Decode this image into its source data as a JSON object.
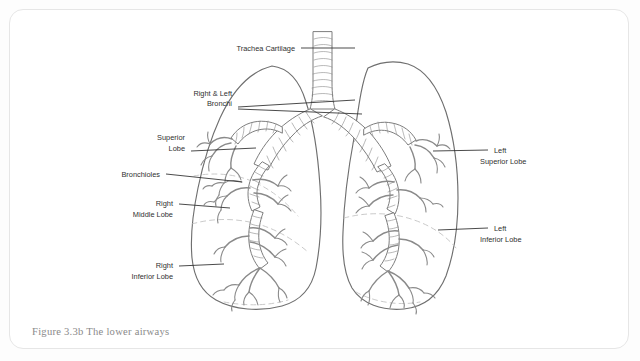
{
  "figure": {
    "caption": "Figure 3.3b The lower airways",
    "title": "The lower airways",
    "diagram_type": "labeled anatomical line drawing"
  },
  "colors": {
    "page_background": "#fdfdfd",
    "card_background": "#ffffff",
    "card_border": "#e6e6e6",
    "outline_stroke": "#6f6f6f",
    "airway_stroke": "#7d7d7d",
    "cartilage_ring_stroke": "#8d8d8d",
    "fissure_stroke": "#c0c0c0",
    "leader_line": "#2b2b2b",
    "label_text": "#2f2f2f",
    "caption_text": "#8a8a8a"
  },
  "labels": [
    {
      "id": "trachea-cartilage",
      "lines": [
        "Trachea Cartilage"
      ],
      "side": "top",
      "align": "end",
      "text_x": 285,
      "text_y": 41,
      "leader": [
        [
          291,
          38
        ],
        [
          345,
          38
        ]
      ]
    },
    {
      "id": "right-and-left-bronchi",
      "lines": [
        "Right & Left",
        "Bronchi"
      ],
      "side": "left",
      "align": "end",
      "text_x": 222,
      "text_y": 86,
      "leader": [
        [
          228,
          97
        ],
        [
          345,
          90
        ]
      ],
      "leader2": [
        [
          228,
          99
        ],
        [
          352,
          104
        ]
      ]
    },
    {
      "id": "superior-lobe",
      "lines": [
        "Superior",
        "Lobe"
      ],
      "side": "left",
      "align": "end",
      "text_x": 175,
      "text_y": 130,
      "leader": [
        [
          181,
          141
        ],
        [
          246,
          138
        ]
      ]
    },
    {
      "id": "bronchioles",
      "lines": [
        "Bronchioles"
      ],
      "side": "left",
      "align": "end",
      "text_x": 150,
      "text_y": 167,
      "leader": [
        [
          156,
          164
        ],
        [
          232,
          172
        ]
      ]
    },
    {
      "id": "right-middle-lobe",
      "lines": [
        "Right",
        "Middle Lobe"
      ],
      "side": "left",
      "align": "end",
      "text_x": 163,
      "text_y": 196,
      "leader": [
        [
          169,
          194
        ],
        [
          220,
          198
        ]
      ]
    },
    {
      "id": "right-inferior-lobe",
      "lines": [
        "Right",
        "Inferior Lobe"
      ],
      "side": "left",
      "align": "end",
      "text_x": 163,
      "text_y": 258,
      "leader": [
        [
          169,
          256
        ],
        [
          214,
          254
        ]
      ]
    },
    {
      "id": "left-superior-lobe",
      "lines": [
        "Left",
        "Superior Lobe"
      ],
      "side": "right",
      "align": "start",
      "text_x": 484,
      "text_y": 143,
      "leader": [
        [
          478,
          140
        ],
        [
          423,
          141
        ]
      ]
    },
    {
      "id": "left-inferior-lobe",
      "lines": [
        "Left",
        "Inferior Lobe"
      ],
      "side": "right",
      "align": "start",
      "text_x": 484,
      "text_y": 221,
      "leader": [
        [
          478,
          218
        ],
        [
          428,
          220
        ]
      ]
    }
  ],
  "anatomy": {
    "trachea": {
      "name": "trachea",
      "cartilage_rings_visible": true,
      "ring_count": 11,
      "top_y": 22,
      "bifurcation_y": 100
    },
    "bronchi": [
      {
        "name": "right-main-bronchus",
        "side": "right"
      },
      {
        "name": "left-main-bronchus",
        "side": "left"
      }
    ],
    "lungs": [
      {
        "name": "right-lung",
        "side": "right",
        "lobes": [
          "Superior Lobe",
          "Right Middle Lobe",
          "Right Inferior Lobe"
        ],
        "fissures": 2
      },
      {
        "name": "left-lung",
        "side": "left",
        "lobes": [
          "Left Superior Lobe",
          "Left Inferior Lobe"
        ],
        "fissures": 1
      }
    ],
    "bronchioles": {
      "name": "bronchioles",
      "terminal_branches": true
    }
  }
}
